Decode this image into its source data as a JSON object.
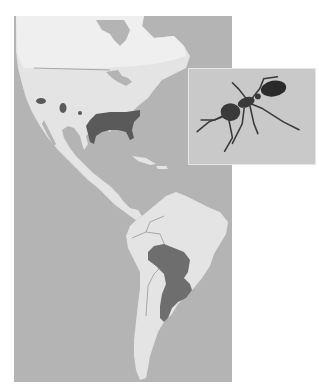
{
  "map": {
    "type": "species-range-map",
    "region": "Americas",
    "colors": {
      "ocean": "#b4b4b4",
      "land": "#e4e4e4",
      "land_highlight": "#f2f2f2",
      "range": "#5a5a5a",
      "borders": "#8c8c8c",
      "inset_background": "#c9c9c9",
      "ant_body": "#3a3a3a"
    },
    "range_areas": [
      "southeastern-united-states",
      "california-patch",
      "arizona-patch",
      "texas-patch",
      "central-south-america"
    ]
  },
  "inset": {
    "subject": "ant",
    "icon": "ant-photo"
  }
}
